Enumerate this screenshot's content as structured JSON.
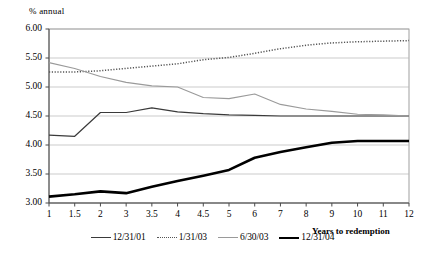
{
  "chart_data": {
    "type": "line",
    "title": "",
    "ylabel": "% annual",
    "xlabel": "Years to redemption",
    "ylim": [
      3.0,
      6.0
    ],
    "ytick_step": 0.5,
    "grid": true,
    "legend_position": "bottom",
    "categories": [
      "1",
      "1.5",
      "2",
      "3",
      "3.5",
      "4",
      "4.5",
      "5",
      "6",
      "7",
      "8",
      "9",
      "10",
      "11",
      "12"
    ],
    "ytick_labels": [
      "6.00",
      "5.50",
      "5.00",
      "4.50",
      "4.00",
      "3.50",
      "3.00"
    ],
    "series": [
      {
        "name": "12/31/01",
        "style": "solid-thin-dark",
        "color": "#3a3a3a",
        "values": [
          4.17,
          4.15,
          4.56,
          4.56,
          4.64,
          4.57,
          4.54,
          4.52,
          4.51,
          4.5,
          4.5,
          4.5,
          4.5,
          4.5,
          4.5
        ]
      },
      {
        "name": "1/31/03",
        "style": "dotted",
        "color": "#555555",
        "values": [
          5.26,
          5.26,
          5.28,
          5.32,
          5.36,
          5.4,
          5.47,
          5.51,
          5.58,
          5.66,
          5.72,
          5.76,
          5.78,
          5.79,
          5.8
        ]
      },
      {
        "name": "6/30/03",
        "style": "solid-thin-gray",
        "color": "#9a9a9a",
        "values": [
          5.42,
          5.32,
          5.18,
          5.08,
          5.02,
          5.0,
          4.82,
          4.8,
          4.88,
          4.7,
          4.62,
          4.58,
          4.53,
          4.52,
          4.5
        ]
      },
      {
        "name": "12/31/04",
        "style": "solid-thick-black",
        "color": "#000000",
        "values": [
          3.11,
          3.15,
          3.2,
          3.17,
          3.28,
          3.38,
          3.47,
          3.57,
          3.78,
          3.88,
          3.96,
          4.04,
          4.07,
          4.07,
          4.07
        ]
      }
    ]
  },
  "legend": {
    "items": [
      {
        "label": "12/31/01",
        "swatch": "solid-thin-dark"
      },
      {
        "label": "1/31/03",
        "swatch": "dotted"
      },
      {
        "label": "6/30/03",
        "swatch": "solid-thin-gray"
      },
      {
        "label": "12/31/04",
        "swatch": "solid-thick-black"
      }
    ]
  }
}
